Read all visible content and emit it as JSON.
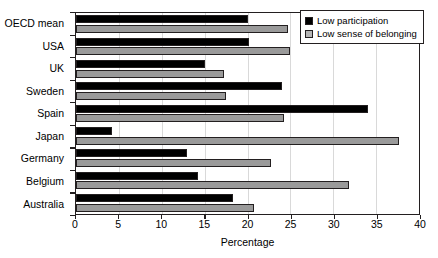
{
  "chart_data": {
    "type": "bar",
    "orientation": "horizontal",
    "title": "",
    "xlabel": "Percentage",
    "ylabel": "",
    "xlim": [
      0,
      40
    ],
    "xticks": [
      0,
      5,
      10,
      15,
      20,
      25,
      30,
      35,
      40
    ],
    "grid": true,
    "legend_position": "top-right",
    "categories": [
      "OECD mean",
      "USA",
      "UK",
      "Sweden",
      "Spain",
      "Japan",
      "Germany",
      "Belgium",
      "Australia"
    ],
    "series": [
      {
        "name": "Low participation",
        "color": "#000000",
        "values": [
          20.0,
          20.2,
          15.0,
          24.0,
          34.0,
          4.2,
          13.0,
          14.2,
          18.3
        ]
      },
      {
        "name": "Low sense of belonging",
        "color": "#9a9a9a",
        "values": [
          24.7,
          25.0,
          17.3,
          17.5,
          24.2,
          37.7,
          22.7,
          31.8,
          20.7
        ]
      }
    ]
  },
  "legend": {
    "items": [
      {
        "label": "Low participation"
      },
      {
        "label": "Low sense of belonging"
      }
    ]
  },
  "colors": {
    "series_0": "#000000",
    "series_1": "#9a9a9a",
    "axis": "#231f20",
    "grid": "#d9d9d9",
    "background": "#ffffff"
  }
}
